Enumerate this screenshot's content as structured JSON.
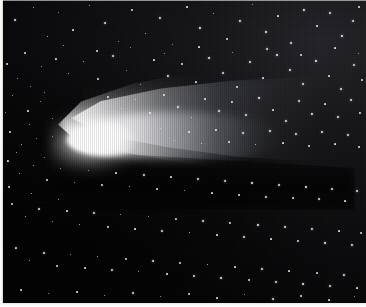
{
  "image": {
    "subject": "comet",
    "common_name": "Halley's Comet",
    "view_type": "astronomical-photograph",
    "medium": "halftone print / photographic plate",
    "orientation": "landscape",
    "width_px": 366,
    "height_px": 307,
    "alt_text": "Black and white astronomical photograph of a bright comet with a blazing white coma at left and a broad dust tail fanning out to the right across a dense field of stars"
  },
  "palette": {
    "sky_dark": "#050506",
    "sky_mid": "#151518",
    "sky_bright": "#24242a",
    "star_white": "#ffffff",
    "coma_white": "#ffffff",
    "paper_margin": "#ffffff"
  },
  "features": {
    "coma": {
      "label": "coma",
      "center_x": 85,
      "center_y": 140,
      "width": 86,
      "height": 32,
      "brightness": "saturated-white"
    },
    "nucleus": {
      "label": "nucleus",
      "center_x": 85,
      "center_y": 140,
      "width": 34,
      "height": 20
    },
    "tail": {
      "label": "dust tail",
      "direction": "right",
      "start_x": 90,
      "end_x": 320,
      "top_y": 60,
      "bottom_y": 185,
      "shape": "fan",
      "fade": "gradual toward the right"
    },
    "star_field": {
      "label": "star field",
      "density": "dense, increasing toward upper right",
      "star_count": 260
    },
    "texture": {
      "label": "halftone scan lines",
      "pattern": "vertical print striping"
    }
  },
  "margins": {
    "left_px": 3,
    "bottom_px": 4,
    "top_px": 1,
    "right_px": 0
  },
  "stars": [
    [
      14,
      19,
      1.4
    ],
    [
      33,
      7,
      1.0
    ],
    [
      47,
      36,
      1.1
    ],
    [
      58,
      12,
      0.9
    ],
    [
      72,
      29,
      1.3
    ],
    [
      89,
      5,
      1.0
    ],
    [
      104,
      22,
      1.5
    ],
    [
      118,
      41,
      1.0
    ],
    [
      131,
      9,
      1.2
    ],
    [
      145,
      33,
      1.1
    ],
    [
      159,
      17,
      1.4
    ],
    [
      172,
      44,
      0.9
    ],
    [
      186,
      6,
      1.3
    ],
    [
      199,
      27,
      1.6
    ],
    [
      213,
      13,
      1.1
    ],
    [
      226,
      38,
      1.2
    ],
    [
      239,
      20,
      1.5
    ],
    [
      252,
      4,
      1.0
    ],
    [
      265,
      31,
      1.7
    ],
    [
      277,
      15,
      1.3
    ],
    [
      290,
      42,
      1.4
    ],
    [
      303,
      9,
      1.6
    ],
    [
      316,
      25,
      1.3
    ],
    [
      329,
      12,
      1.5
    ],
    [
      341,
      35,
      1.7
    ],
    [
      352,
      20,
      1.4
    ],
    [
      358,
      6,
      1.2
    ],
    [
      24,
      52,
      1.2
    ],
    [
      41,
      66,
      0.9
    ],
    [
      55,
      58,
      1.3
    ],
    [
      68,
      73,
      1.1
    ],
    [
      83,
      61,
      1.0
    ],
    [
      97,
      78,
      1.2
    ],
    [
      112,
      55,
      1.4
    ],
    [
      126,
      70,
      1.0
    ],
    [
      140,
      84,
      1.1
    ],
    [
      153,
      59,
      1.3
    ],
    [
      167,
      75,
      1.5
    ],
    [
      181,
      63,
      1.2
    ],
    [
      195,
      81,
      1.3
    ],
    [
      208,
      57,
      1.6
    ],
    [
      222,
      72,
      1.4
    ],
    [
      236,
      86,
      1.2
    ],
    [
      249,
      61,
      1.5
    ],
    [
      262,
      77,
      1.3
    ],
    [
      276,
      54,
      1.7
    ],
    [
      289,
      69,
      1.5
    ],
    [
      302,
      83,
      1.4
    ],
    [
      315,
      60,
      1.6
    ],
    [
      328,
      75,
      1.3
    ],
    [
      340,
      88,
      1.5
    ],
    [
      353,
      64,
      1.4
    ],
    [
      361,
      79,
      1.2
    ],
    [
      12,
      95,
      1.1
    ],
    [
      27,
      110,
      1.3
    ],
    [
      40,
      101,
      0.9
    ],
    [
      52,
      118,
      1.0
    ],
    [
      107,
      96,
      1.2
    ],
    [
      121,
      108,
      1.0
    ],
    [
      135,
      99,
      1.1
    ],
    [
      149,
      112,
      1.3
    ],
    [
      163,
      94,
      1.2
    ],
    [
      177,
      106,
      1.4
    ],
    [
      191,
      117,
      1.1
    ],
    [
      204,
      98,
      1.3
    ],
    [
      218,
      110,
      1.5
    ],
    [
      231,
      101,
      1.2
    ],
    [
      245,
      114,
      1.4
    ],
    [
      258,
      97,
      1.6
    ],
    [
      272,
      109,
      1.3
    ],
    [
      285,
      120,
      1.5
    ],
    [
      298,
      100,
      1.4
    ],
    [
      311,
      113,
      1.6
    ],
    [
      324,
      103,
      1.3
    ],
    [
      337,
      116,
      1.5
    ],
    [
      350,
      99,
      1.4
    ],
    [
      359,
      112,
      1.2
    ],
    [
      9,
      131,
      1.2
    ],
    [
      21,
      144,
      1.0
    ],
    [
      36,
      138,
      0.9
    ],
    [
      160,
      128,
      1.1
    ],
    [
      174,
      140,
      1.0
    ],
    [
      188,
      131,
      1.2
    ],
    [
      201,
      143,
      1.1
    ],
    [
      215,
      129,
      1.3
    ],
    [
      228,
      141,
      1.2
    ],
    [
      242,
      132,
      1.4
    ],
    [
      255,
      144,
      1.1
    ],
    [
      269,
      130,
      1.5
    ],
    [
      282,
      142,
      1.3
    ],
    [
      295,
      133,
      1.4
    ],
    [
      308,
      145,
      1.2
    ],
    [
      321,
      131,
      1.5
    ],
    [
      334,
      143,
      1.3
    ],
    [
      347,
      134,
      1.4
    ],
    [
      358,
      146,
      1.2
    ],
    [
      7,
      160,
      1.3
    ],
    [
      19,
      173,
      1.1
    ],
    [
      33,
      165,
      1.0
    ],
    [
      46,
      179,
      1.2
    ],
    [
      60,
      168,
      0.9
    ],
    [
      74,
      182,
      1.1
    ],
    [
      88,
      170,
      1.0
    ],
    [
      101,
      184,
      1.2
    ],
    [
      115,
      172,
      1.3
    ],
    [
      129,
      186,
      1.1
    ],
    [
      143,
      174,
      1.4
    ],
    [
      156,
      188,
      1.2
    ],
    [
      170,
      176,
      1.3
    ],
    [
      184,
      190,
      1.1
    ],
    [
      197,
      178,
      1.5
    ],
    [
      211,
      192,
      1.3
    ],
    [
      224,
      180,
      1.4
    ],
    [
      238,
      194,
      1.2
    ],
    [
      251,
      182,
      1.6
    ],
    [
      265,
      196,
      1.4
    ],
    [
      278,
      184,
      1.5
    ],
    [
      292,
      197,
      1.3
    ],
    [
      305,
      186,
      1.6
    ],
    [
      318,
      198,
      1.4
    ],
    [
      331,
      188,
      1.5
    ],
    [
      344,
      200,
      1.3
    ],
    [
      356,
      190,
      1.4
    ],
    [
      11,
      203,
      1.2
    ],
    [
      25,
      216,
      1.0
    ],
    [
      38,
      208,
      1.4
    ],
    [
      52,
      221,
      1.1
    ],
    [
      66,
      210,
      1.3
    ],
    [
      79,
      224,
      1.0
    ],
    [
      93,
      212,
      1.5
    ],
    [
      107,
      226,
      1.2
    ],
    [
      120,
      214,
      1.1
    ],
    [
      134,
      228,
      1.3
    ],
    [
      148,
      216,
      1.0
    ],
    [
      161,
      230,
      1.4
    ],
    [
      175,
      218,
      1.2
    ],
    [
      189,
      232,
      1.1
    ],
    [
      202,
      220,
      1.5
    ],
    [
      216,
      234,
      1.3
    ],
    [
      229,
      222,
      1.2
    ],
    [
      243,
      236,
      1.4
    ],
    [
      257,
      224,
      1.6
    ],
    [
      270,
      238,
      1.3
    ],
    [
      284,
      226,
      1.5
    ],
    [
      297,
      240,
      1.2
    ],
    [
      311,
      228,
      1.4
    ],
    [
      324,
      242,
      1.6
    ],
    [
      338,
      230,
      1.3
    ],
    [
      351,
      244,
      1.5
    ],
    [
      360,
      232,
      1.2
    ],
    [
      15,
      247,
      1.3
    ],
    [
      29,
      260,
      1.1
    ],
    [
      43,
      252,
      1.5
    ],
    [
      56,
      265,
      1.2
    ],
    [
      70,
      254,
      1.0
    ],
    [
      84,
      267,
      1.3
    ],
    [
      97,
      256,
      1.1
    ],
    [
      111,
      269,
      1.4
    ],
    [
      125,
      258,
      1.2
    ],
    [
      138,
      271,
      1.0
    ],
    [
      152,
      260,
      1.5
    ],
    [
      166,
      273,
      1.3
    ],
    [
      179,
      262,
      1.2
    ],
    [
      193,
      275,
      1.4
    ],
    [
      207,
      264,
      1.1
    ],
    [
      220,
      277,
      1.6
    ],
    [
      234,
      266,
      1.3
    ],
    [
      248,
      279,
      1.2
    ],
    [
      261,
      268,
      1.5
    ],
    [
      275,
      281,
      1.4
    ],
    [
      288,
      270,
      1.3
    ],
    [
      302,
      283,
      1.6
    ],
    [
      316,
      272,
      1.2
    ],
    [
      329,
      285,
      1.4
    ],
    [
      343,
      274,
      1.5
    ],
    [
      356,
      287,
      1.3
    ],
    [
      20,
      289,
      1.2
    ],
    [
      48,
      293,
      1.0
    ],
    [
      76,
      291,
      1.3
    ],
    [
      104,
      295,
      1.1
    ],
    [
      132,
      292,
      1.4
    ],
    [
      160,
      296,
      1.0
    ],
    [
      188,
      293,
      1.2
    ],
    [
      216,
      297,
      1.3
    ],
    [
      244,
      294,
      1.1
    ],
    [
      272,
      298,
      1.4
    ],
    [
      300,
      295,
      1.2
    ],
    [
      328,
      299,
      1.3
    ],
    [
      354,
      296,
      1.1
    ],
    [
      63,
      45,
      1.0
    ],
    [
      96,
      50,
      1.2
    ],
    [
      130,
      47,
      0.9
    ],
    [
      164,
      53,
      1.1
    ],
    [
      198,
      46,
      1.3
    ],
    [
      232,
      52,
      1.0
    ],
    [
      266,
      48,
      1.4
    ],
    [
      300,
      54,
      1.2
    ],
    [
      334,
      47,
      1.3
    ],
    [
      358,
      53,
      1.0
    ],
    [
      30,
      86,
      1.1
    ],
    [
      17,
      78,
      0.9
    ],
    [
      44,
      92,
      1.0
    ],
    [
      6,
      63,
      1.2
    ],
    [
      5,
      112,
      0.9
    ],
    [
      29,
      124,
      1.0
    ],
    [
      16,
      152,
      1.1
    ],
    [
      44,
      157,
      0.9
    ],
    [
      8,
      186,
      1.2
    ],
    [
      31,
      193,
      1.0
    ],
    [
      58,
      199,
      1.1
    ],
    [
      72,
      146,
      0.8
    ],
    [
      52,
      136,
      0.8
    ]
  ]
}
